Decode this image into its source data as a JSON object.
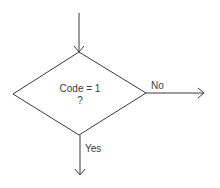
{
  "diagram": {
    "type": "flowchart-decision",
    "decision": {
      "line1": "Code = 1",
      "line2": "?"
    },
    "branches": {
      "no_label": "No",
      "yes_label": "Yes"
    },
    "colors": {
      "stroke": "#3a3a3a",
      "text": "#3a3a3a",
      "background": "#ffffff"
    }
  }
}
